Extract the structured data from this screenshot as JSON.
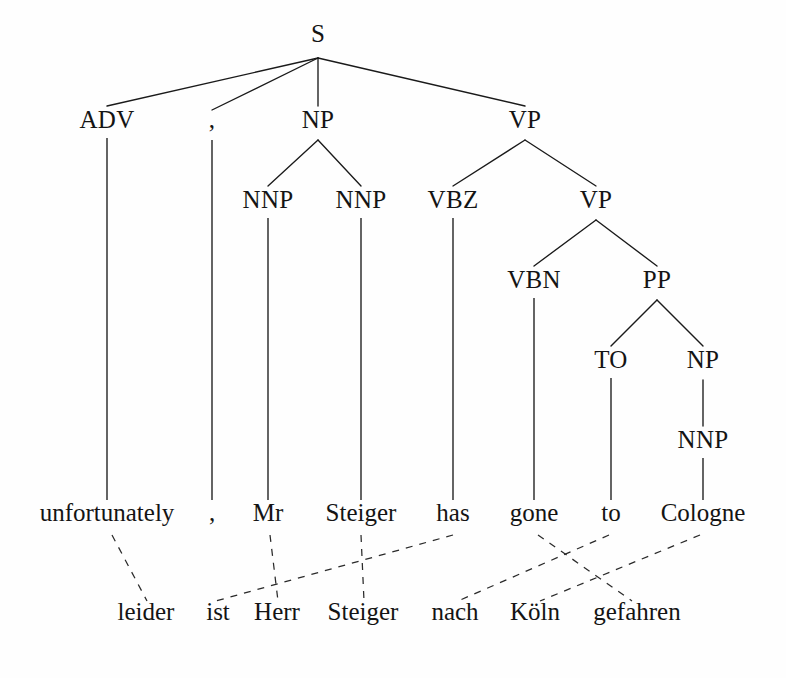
{
  "figure": {
    "kind": "syntactic-parse-tree-with-word-alignment",
    "background_color": "#fefefe",
    "ink_color": "#141414",
    "width": 786,
    "height": 678
  },
  "nodes": {
    "s": {
      "label": "S",
      "x": 318,
      "y": 42
    },
    "adv": {
      "label": "ADV",
      "x": 107,
      "y": 128
    },
    "comma_pos": {
      "label": ",",
      "x": 212,
      "y": 128
    },
    "np1": {
      "label": "NP",
      "x": 318,
      "y": 128
    },
    "vp1": {
      "label": "VP",
      "x": 525,
      "y": 128
    },
    "nnp1": {
      "label": "NNP",
      "x": 268,
      "y": 208
    },
    "nnp2": {
      "label": "NNP",
      "x": 361,
      "y": 208
    },
    "vbz": {
      "label": "VBZ",
      "x": 453,
      "y": 208
    },
    "vp2": {
      "label": "VP",
      "x": 596,
      "y": 208
    },
    "vbn": {
      "label": "VBN",
      "x": 534,
      "y": 288
    },
    "pp": {
      "label": "PP",
      "x": 657,
      "y": 288
    },
    "to": {
      "label": "TO",
      "x": 611,
      "y": 368
    },
    "np2": {
      "label": "NP",
      "x": 703,
      "y": 368
    },
    "nnp3": {
      "label": "NNP",
      "x": 703,
      "y": 448
    }
  },
  "source_sentence": {
    "language_note": "English",
    "y": 521,
    "words": [
      {
        "text": "unfortunately",
        "x": 107
      },
      {
        "text": ",",
        "x": 212
      },
      {
        "text": "Mr",
        "x": 268
      },
      {
        "text": "Steiger",
        "x": 361
      },
      {
        "text": "has",
        "x": 453
      },
      {
        "text": "gone",
        "x": 534
      },
      {
        "text": "to",
        "x": 611
      },
      {
        "text": "Cologne",
        "x": 703
      }
    ]
  },
  "target_sentence": {
    "language_note": "German",
    "y": 620,
    "words": [
      {
        "text": "leider",
        "x": 146
      },
      {
        "text": "ist",
        "x": 218
      },
      {
        "text": "Herr",
        "x": 277
      },
      {
        "text": "Steiger",
        "x": 363
      },
      {
        "text": "nach",
        "x": 455
      },
      {
        "text": "Köln",
        "x": 535
      },
      {
        "text": "gefahren",
        "x": 637
      }
    ]
  },
  "branches": [
    {
      "name": "s-to-adv",
      "x1": 318,
      "y1": 58,
      "x2": 107,
      "y2": 106
    },
    {
      "name": "s-to-comma",
      "x1": 318,
      "y1": 58,
      "x2": 212,
      "y2": 110
    },
    {
      "name": "s-to-np",
      "x1": 318,
      "y1": 58,
      "x2": 318,
      "y2": 106
    },
    {
      "name": "s-to-vp",
      "x1": 318,
      "y1": 58,
      "x2": 525,
      "y2": 106
    },
    {
      "name": "np-to-nnp1",
      "x1": 318,
      "y1": 140,
      "x2": 268,
      "y2": 186
    },
    {
      "name": "np-to-nnp2",
      "x1": 318,
      "y1": 140,
      "x2": 361,
      "y2": 186
    },
    {
      "name": "vp1-to-vbz",
      "x1": 525,
      "y1": 140,
      "x2": 453,
      "y2": 186
    },
    {
      "name": "vp1-to-vp2",
      "x1": 525,
      "y1": 140,
      "x2": 596,
      "y2": 186
    },
    {
      "name": "vp2-to-vbn",
      "x1": 596,
      "y1": 220,
      "x2": 534,
      "y2": 266
    },
    {
      "name": "vp2-to-pp",
      "x1": 596,
      "y1": 220,
      "x2": 657,
      "y2": 266
    },
    {
      "name": "pp-to-to",
      "x1": 657,
      "y1": 300,
      "x2": 611,
      "y2": 346
    },
    {
      "name": "pp-to-np2",
      "x1": 657,
      "y1": 300,
      "x2": 703,
      "y2": 346
    },
    {
      "name": "np2-to-nnp3",
      "x1": 703,
      "y1": 380,
      "x2": 703,
      "y2": 426
    }
  ],
  "legs": [
    {
      "name": "adv-leg",
      "x": 107,
      "y1": 138,
      "y2": 500
    },
    {
      "name": "comma-leg",
      "x": 212,
      "y1": 140,
      "y2": 500
    },
    {
      "name": "nnp1-leg",
      "x": 268,
      "y1": 218,
      "y2": 500
    },
    {
      "name": "nnp2-leg",
      "x": 361,
      "y1": 218,
      "y2": 500
    },
    {
      "name": "vbz-leg",
      "x": 453,
      "y1": 218,
      "y2": 500
    },
    {
      "name": "vbn-leg",
      "x": 534,
      "y1": 298,
      "y2": 500
    },
    {
      "name": "to-leg",
      "x": 611,
      "y1": 378,
      "y2": 500
    },
    {
      "name": "nnp3-leg",
      "x": 703,
      "y1": 458,
      "y2": 500
    }
  ],
  "alignments": [
    {
      "name": "unfortunately-leider",
      "source": "unfortunately",
      "target": "leider",
      "x1": 112,
      "y1": 535,
      "x2": 147,
      "y2": 601
    },
    {
      "name": "mr-herr",
      "source": "Mr",
      "target": "Herr",
      "x1": 270,
      "y1": 535,
      "x2": 278,
      "y2": 601
    },
    {
      "name": "steiger-steiger",
      "source": "Steiger",
      "target": "Steiger",
      "x1": 361,
      "y1": 535,
      "x2": 364,
      "y2": 601
    },
    {
      "name": "has-ist",
      "source": "has",
      "target": "ist",
      "x1": 453,
      "y1": 535,
      "x2": 216,
      "y2": 601
    },
    {
      "name": "gone-gefahren",
      "source": "gone",
      "target": "gefahren",
      "x1": 538,
      "y1": 535,
      "x2": 632,
      "y2": 601
    },
    {
      "name": "to-nach",
      "source": "to",
      "target": "nach",
      "x1": 609,
      "y1": 535,
      "x2": 458,
      "y2": 601
    },
    {
      "name": "cologne-koln",
      "source": "Cologne",
      "target": "Köln",
      "x1": 700,
      "y1": 535,
      "x2": 540,
      "y2": 601
    }
  ]
}
